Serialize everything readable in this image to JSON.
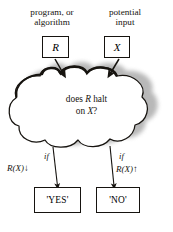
{
  "figure": {
    "background_color": "#ffffff",
    "ink_color": "#16130f",
    "shadow_color": "#8d8d8d"
  },
  "inputs": [
    {
      "caption_line1": "program, or",
      "caption_line2": "algorithm",
      "box_label": "R"
    },
    {
      "caption_line1": "potential",
      "caption_line2": "input",
      "box_label": "X"
    }
  ],
  "cloud": {
    "question_line1_pre": "does ",
    "question_line1_var": "R",
    "question_line1_post": " halt",
    "question_line2_pre": "on ",
    "question_line2_var": "X",
    "question_line2_post": "?"
  },
  "branches": [
    {
      "if_label": "if",
      "condition": "R(X)",
      "arrow_glyph": "↓",
      "result_label": "'YES'"
    },
    {
      "if_label": "if",
      "condition": "R(X)",
      "arrow_glyph": "↑",
      "result_label": "'NO'"
    }
  ]
}
